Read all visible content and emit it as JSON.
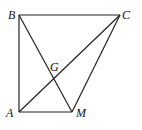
{
  "diagram": {
    "type": "geometry",
    "points": {
      "A": {
        "label": "A",
        "x": 19,
        "y": 112
      },
      "B": {
        "label": "B",
        "x": 19,
        "y": 15
      },
      "C": {
        "label": "C",
        "x": 120,
        "y": 15
      },
      "M": {
        "label": "M",
        "x": 72,
        "y": 112
      },
      "G": {
        "label": "G"
      }
    },
    "segments": [
      "AB",
      "BC",
      "CM",
      "MA",
      "AC",
      "BM"
    ],
    "labels": {
      "A": "A",
      "B": "B",
      "C": "C",
      "M": "M",
      "G": "G"
    }
  }
}
